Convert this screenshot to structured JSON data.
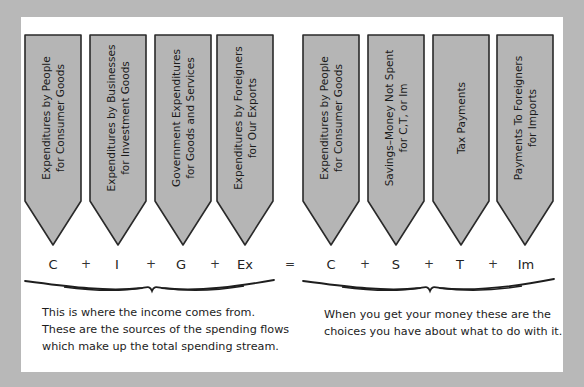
{
  "diagram": {
    "colors": {
      "background": "#b8b8b8",
      "panel": "#ffffff",
      "arrow_fill": "#b5b5b5",
      "arrow_stroke": "#2a2a2a",
      "text": "#1c1c1c"
    },
    "left_arrows": [
      {
        "line1": "Expenditures by People",
        "line2": "for Consumer Goods",
        "symbol": "C"
      },
      {
        "line1": "Expenditures by Businesses",
        "line2": "for Investment Goods",
        "symbol": "I"
      },
      {
        "line1": "Government Expenditures",
        "line2": "for Goods and Services",
        "symbol": "G"
      },
      {
        "line1": "Expenditures by Foreigners",
        "line2": "for Our Exports",
        "symbol": "Ex"
      }
    ],
    "right_arrows": [
      {
        "line1": "Expenditures by People",
        "line2": "for Consumer Goods",
        "symbol": "C"
      },
      {
        "line1": "Savings–Money Not Spent",
        "line2": "for C,T, or Im",
        "symbol": "S"
      },
      {
        "line1": "Tax Payments",
        "line2": "",
        "symbol": "T"
      },
      {
        "line1": "Payments To Foreigners",
        "line2": "for Imports",
        "symbol": "Im"
      }
    ],
    "operators": {
      "plus": "+",
      "equals": "="
    },
    "equation": "C + I + G + Ex = C + S + T + Im",
    "left_caption": {
      "lines": [
        "This is where the income comes from.",
        "These are the sources of the spending flows",
        "which make up the total spending stream."
      ]
    },
    "right_caption": {
      "lines": [
        "When you get your money these are the",
        "choices you have about what to do with it."
      ]
    }
  }
}
